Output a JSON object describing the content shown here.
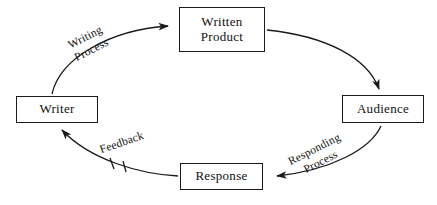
{
  "diagram": {
    "type": "cycle",
    "title": "",
    "background_color": "#ffffff",
    "stroke_color": "#1a1a1a",
    "text_color": "#111111",
    "nodes": [
      {
        "id": "written-product",
        "label": "Written\nProduct",
        "position": "top"
      },
      {
        "id": "audience",
        "label": "Audience",
        "position": "right"
      },
      {
        "id": "response",
        "label": "Response",
        "position": "bottom"
      },
      {
        "id": "writer",
        "label": "Writer",
        "position": "left"
      }
    ],
    "edges": [
      {
        "id": "writing-process",
        "from": "writer",
        "to": "written-product",
        "label": "Writing\nProcess",
        "arrowhead": "filled",
        "marker": "none"
      },
      {
        "id": "delivery",
        "from": "written-product",
        "to": "audience",
        "label": "",
        "arrowhead": "filled",
        "marker": "none"
      },
      {
        "id": "responding-process",
        "from": "audience",
        "to": "response",
        "label": "Responding\nProcess",
        "arrowhead": "filled",
        "marker": "none"
      },
      {
        "id": "feedback",
        "from": "response",
        "to": "writer",
        "label": "Feedback",
        "arrowhead": "filled",
        "marker": "break-ticks"
      }
    ]
  }
}
